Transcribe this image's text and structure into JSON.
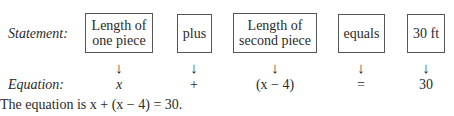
{
  "statement_label": "Statement:",
  "equation_label": "Equation:",
  "columns": [
    {
      "box_line1": "Length of",
      "box_line2": "one piece",
      "arrow": "↓",
      "equation": "x"
    },
    {
      "box_line1": "plus",
      "box_line2": "",
      "arrow": "↓",
      "equation": "+"
    },
    {
      "box_line1": "Length of",
      "box_line2": "second piece",
      "arrow": "↓",
      "equation": "(x − 4)"
    },
    {
      "box_line1": "equals",
      "box_line2": "",
      "arrow": "↓",
      "equation": "="
    },
    {
      "box_line1": "30 ft",
      "box_line2": "",
      "arrow": "↓",
      "equation": "30"
    }
  ],
  "conclusion": {
    "prefix": "The equation is ",
    "equation": "x + (x − 4) = 30."
  }
}
